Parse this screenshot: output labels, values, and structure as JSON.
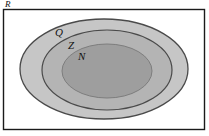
{
  "diagram": {
    "type": "nested-set-venn",
    "title_label": "",
    "universe": {
      "name": "universe-rectangle",
      "label": "R",
      "description": "Real numbers outer rectangle",
      "fill": "#ffffff",
      "stroke": "#1a1a1a",
      "label_x": 5,
      "label_y": 7
    },
    "sets": [
      {
        "name": "set-q",
        "label": "Q",
        "description": "Rational numbers",
        "fill": "#c6c6c6",
        "stroke": "#4a4a4a",
        "cx": 104,
        "cy": 69,
        "rx": 84,
        "ry": 50,
        "label_x": 55,
        "label_y": 36
      },
      {
        "name": "set-z",
        "label": "Z",
        "description": "Integers",
        "fill": "#b4b4b4",
        "stroke": "#4a4a4a",
        "cx": 107,
        "cy": 70,
        "rx": 65,
        "ry": 40,
        "label_x": 68,
        "label_y": 49
      },
      {
        "name": "set-n",
        "label": "N",
        "description": "Natural numbers",
        "fill": "#9e9e9e",
        "stroke": "#7a7a7a",
        "cx": 107,
        "cy": 71,
        "rx": 45,
        "ry": 27,
        "label_x": 78,
        "label_y": 60
      }
    ],
    "colors": {
      "background": "#ffffff",
      "border": "#1a1a1a",
      "ring_outer": "#c6c6c6",
      "ring_middle": "#b4b4b4",
      "core": "#9e9e9e",
      "text": "#121212"
    }
  }
}
